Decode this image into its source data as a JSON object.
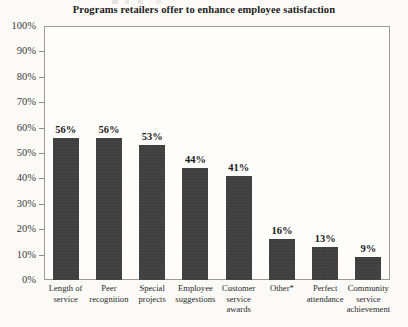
{
  "chart_data": {
    "type": "bar",
    "title": "Programs retailers offer to enhance employee satisfaction",
    "xlabel": "",
    "ylabel": "",
    "ylim": [
      0,
      100
    ],
    "grid": false,
    "legend": "none",
    "categories": [
      "Length of service",
      "Peer recognition",
      "Special projects",
      "Employee suggestions",
      "Customer service awards",
      "Other*",
      "Perfect attendance",
      "Community service achievement"
    ],
    "values": [
      56,
      56,
      53,
      44,
      41,
      16,
      13,
      9
    ],
    "value_labels": [
      "56%",
      "56%",
      "53%",
      "44%",
      "41%",
      "16%",
      "13%",
      "9%"
    ],
    "ytick_labels": [
      "100%",
      "90%",
      "80%",
      "70%",
      "60%",
      "50%",
      "40%",
      "30%",
      "20%",
      "10%",
      "0%"
    ],
    "ytick_values": [
      100,
      90,
      80,
      70,
      60,
      50,
      40,
      30,
      20,
      10,
      0
    ],
    "bar_color": "#3e3e3e",
    "frame_color": "#9a9a9a",
    "background_color": "#fbfaf7",
    "category_lines": [
      [
        "Length of",
        "service"
      ],
      [
        "Peer",
        "recognition"
      ],
      [
        "Special",
        "projects"
      ],
      [
        "Employee",
        "suggestions"
      ],
      [
        "Customer",
        "service",
        "awards"
      ],
      [
        "Other*"
      ],
      [
        "Perfect",
        "attendance"
      ],
      [
        "Community",
        "service",
        "achievement"
      ]
    ]
  }
}
